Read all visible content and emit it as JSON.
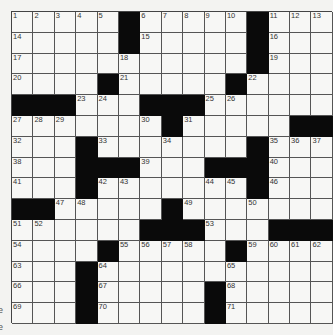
{
  "puzzle": {
    "rows": 15,
    "cols": 15,
    "blocks": [
      [
        1,
        6
      ],
      [
        1,
        12
      ],
      [
        2,
        6
      ],
      [
        2,
        12
      ],
      [
        3,
        12
      ],
      [
        4,
        5
      ],
      [
        4,
        11
      ],
      [
        5,
        1
      ],
      [
        5,
        2
      ],
      [
        5,
        3
      ],
      [
        5,
        7
      ],
      [
        5,
        8
      ],
      [
        5,
        9
      ],
      [
        6,
        8
      ],
      [
        6,
        14
      ],
      [
        6,
        15
      ],
      [
        7,
        4
      ],
      [
        7,
        12
      ],
      [
        8,
        4
      ],
      [
        8,
        5
      ],
      [
        8,
        6
      ],
      [
        8,
        10
      ],
      [
        8,
        11
      ],
      [
        8,
        12
      ],
      [
        9,
        4
      ],
      [
        9,
        12
      ],
      [
        10,
        1
      ],
      [
        10,
        2
      ],
      [
        10,
        8
      ],
      [
        11,
        7
      ],
      [
        11,
        8
      ],
      [
        11,
        9
      ],
      [
        11,
        13
      ],
      [
        11,
        14
      ],
      [
        11,
        15
      ],
      [
        12,
        5
      ],
      [
        12,
        11
      ],
      [
        13,
        4
      ],
      [
        14,
        4
      ],
      [
        14,
        10
      ],
      [
        15,
        4
      ],
      [
        15,
        10
      ]
    ],
    "numbers": [
      [
        1,
        1,
        "1"
      ],
      [
        1,
        2,
        "2"
      ],
      [
        1,
        3,
        "3"
      ],
      [
        1,
        4,
        "4"
      ],
      [
        1,
        5,
        "5"
      ],
      [
        1,
        7,
        "6"
      ],
      [
        1,
        8,
        "7"
      ],
      [
        1,
        9,
        "8"
      ],
      [
        1,
        10,
        "9"
      ],
      [
        1,
        11,
        "10"
      ],
      [
        1,
        13,
        "11"
      ],
      [
        1,
        14,
        "12"
      ],
      [
        1,
        15,
        "13"
      ],
      [
        2,
        1,
        "14"
      ],
      [
        2,
        7,
        "15"
      ],
      [
        2,
        13,
        "16"
      ],
      [
        3,
        1,
        "17"
      ],
      [
        3,
        6,
        "18"
      ],
      [
        3,
        13,
        "19"
      ],
      [
        4,
        1,
        "20"
      ],
      [
        4,
        6,
        "21"
      ],
      [
        4,
        12,
        "22"
      ],
      [
        5,
        4,
        "23"
      ],
      [
        5,
        5,
        "24"
      ],
      [
        5,
        10,
        "25"
      ],
      [
        5,
        11,
        "26"
      ],
      [
        6,
        1,
        "27"
      ],
      [
        6,
        2,
        "28"
      ],
      [
        6,
        3,
        "29"
      ],
      [
        6,
        7,
        "30"
      ],
      [
        6,
        9,
        "31"
      ],
      [
        7,
        1,
        "32"
      ],
      [
        7,
        5,
        "33"
      ],
      [
        7,
        8,
        "34"
      ],
      [
        7,
        13,
        "35"
      ],
      [
        7,
        14,
        "36"
      ],
      [
        7,
        15,
        "37"
      ],
      [
        8,
        1,
        "38"
      ],
      [
        8,
        7,
        "39"
      ],
      [
        8,
        13,
        "40"
      ],
      [
        9,
        1,
        "41"
      ],
      [
        9,
        5,
        "42"
      ],
      [
        9,
        6,
        "43"
      ],
      [
        9,
        10,
        "44"
      ],
      [
        9,
        11,
        "45"
      ],
      [
        9,
        13,
        "46"
      ],
      [
        10,
        3,
        "47"
      ],
      [
        10,
        4,
        "48"
      ],
      [
        10,
        9,
        "49"
      ],
      [
        10,
        12,
        "50"
      ],
      [
        11,
        1,
        "51"
      ],
      [
        11,
        2,
        "52"
      ],
      [
        11,
        10,
        "53"
      ],
      [
        12,
        1,
        "54"
      ],
      [
        12,
        6,
        "55"
      ],
      [
        12,
        7,
        "56"
      ],
      [
        12,
        8,
        "57"
      ],
      [
        12,
        9,
        "58"
      ],
      [
        12,
        12,
        "59"
      ],
      [
        12,
        13,
        "60"
      ],
      [
        12,
        14,
        "61"
      ],
      [
        12,
        15,
        "62"
      ],
      [
        13,
        1,
        "63"
      ],
      [
        13,
        5,
        "64"
      ],
      [
        13,
        11,
        "65"
      ],
      [
        14,
        1,
        "66"
      ],
      [
        14,
        5,
        "67"
      ],
      [
        14,
        11,
        "68"
      ],
      [
        15,
        1,
        "69"
      ],
      [
        15,
        5,
        "70"
      ],
      [
        15,
        11,
        "71"
      ]
    ]
  },
  "margin_fragments": [
    {
      "text": "e",
      "top": 305
    },
    {
      "text": "e",
      "top": 322
    }
  ]
}
